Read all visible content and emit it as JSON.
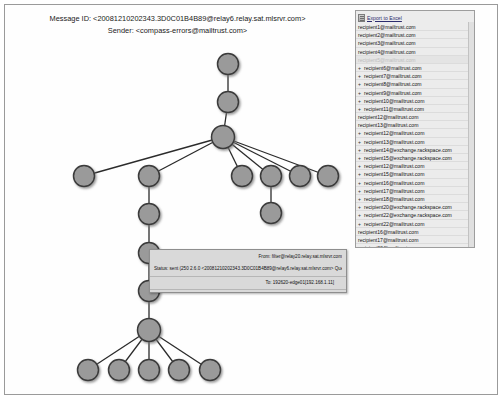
{
  "header": {
    "message_id_label": "Message ID:",
    "message_id": "<20081210202343.3D0C01B4B89@relay6.relay.sat.mlsrvr.com>",
    "message_id_line": "Message ID: <20081210202343.3D0C01B4B89@relay6.relay.sat.mlsrvr.com>",
    "sender_label": "Sender:",
    "sender": "<compass-errors@mailtrust.com>",
    "sender_line": "Sender: <compass-errors@mailtrust.com>"
  },
  "recipients_panel": {
    "export_label": "Export to Excel",
    "export_icon": "excel-icon",
    "items": [
      {
        "marker": "",
        "address": "recipient1@mailtrust.com",
        "selected": false
      },
      {
        "marker": "",
        "address": "recipient2@mailtrust.com",
        "selected": false
      },
      {
        "marker": "",
        "address": "recipient3@mailtrust.com",
        "selected": false
      },
      {
        "marker": "",
        "address": "recipient4@mailtrust.com",
        "selected": false
      },
      {
        "marker": "",
        "address": "recipient5@mailtrust.com",
        "selected": true
      },
      {
        "marker": "+",
        "address": "recipient6@mailtrust.com",
        "selected": false
      },
      {
        "marker": "+",
        "address": "recipient7@mailtrust.com",
        "selected": false
      },
      {
        "marker": "+",
        "address": "recipient8@mailtrust.com",
        "selected": false
      },
      {
        "marker": "+",
        "address": "recipient9@mailtrust.com",
        "selected": false
      },
      {
        "marker": "+",
        "address": "recipient10@mailtrust.com",
        "selected": false
      },
      {
        "marker": "+",
        "address": "recipient11@mailtrust.com",
        "selected": false
      },
      {
        "marker": "",
        "address": "recipient12@mailtrust.com",
        "selected": false
      },
      {
        "marker": "",
        "address": "recipient13@mailtrust.com",
        "selected": false
      },
      {
        "marker": "+",
        "address": "recipient12@mailtrust.com",
        "selected": false
      },
      {
        "marker": "+",
        "address": "recipient13@mailtrust.com",
        "selected": false
      },
      {
        "marker": "+",
        "address": "recipient14@exchange.rackspace.com",
        "selected": false
      },
      {
        "marker": "+",
        "address": "recipient15@exchange.rackspace.com",
        "selected": false
      },
      {
        "marker": "+",
        "address": "recipient12@mailtrust.com",
        "selected": false
      },
      {
        "marker": "+",
        "address": "recipient15@mailtrust.com",
        "selected": false
      },
      {
        "marker": "+",
        "address": "recipient16@mailtrust.com",
        "selected": false
      },
      {
        "marker": "+",
        "address": "recipient17@mailtrust.com",
        "selected": false
      },
      {
        "marker": "+",
        "address": "recipient18@mailtrust.com",
        "selected": false
      },
      {
        "marker": "+",
        "address": "recipient20@exchange.rackspace.com",
        "selected": false
      },
      {
        "marker": "+",
        "address": "recipient22@exchange.rackspace.com",
        "selected": false
      },
      {
        "marker": "+",
        "address": "recipient22@mailtrust.com",
        "selected": false
      },
      {
        "marker": "",
        "address": "recipient16@mailtrust.com",
        "selected": false
      },
      {
        "marker": "",
        "address": "recipient17@mailtrust.com",
        "selected": false
      },
      {
        "marker": "",
        "address": "recipient23@mailtrust.com",
        "selected": false
      },
      {
        "marker": "",
        "address": "recipient19@mailtrust.com",
        "selected": false
      },
      {
        "marker": "",
        "address": "recipient24@mailtrust.com",
        "selected": false
      },
      {
        "marker": "",
        "address": "recipient22@mailtrust.com",
        "selected": false
      }
    ]
  },
  "infobox": {
    "from_line": "From: filter@relay20.relay.sat.mlsrvr.com",
    "status_line": "Status: sent (250 2.6.0 <20081210202343.3D0C01B4B89@relay6.relay.sat.mlsrvr.com> Queued mail for delivery) 2008-12-10 15:23:43",
    "to_line": "To: 192620-edge01[192.168.1.11]"
  },
  "graph": {
    "node_fill": "#9a9a9a",
    "node_stroke": "#3a3a3a",
    "edge_color": "#2b2b2b",
    "nodes": [
      {
        "id": "n1",
        "name": "root-node",
        "x": 222,
        "y": 58,
        "r": 10.5
      },
      {
        "id": "n2",
        "name": "relay-node",
        "x": 222,
        "y": 96,
        "r": 10.5
      },
      {
        "id": "n3",
        "name": "hub-node",
        "x": 217,
        "y": 131,
        "r": 11.5
      },
      {
        "id": "n4",
        "name": "branch-left-far",
        "x": 78,
        "y": 170,
        "r": 10.5
      },
      {
        "id": "n5",
        "name": "branch-left-mid",
        "x": 143,
        "y": 170,
        "r": 10.5
      },
      {
        "id": "n6",
        "name": "branch-right-1",
        "x": 236,
        "y": 170,
        "r": 10.5
      },
      {
        "id": "n7",
        "name": "branch-right-2",
        "x": 265,
        "y": 170,
        "r": 10.5
      },
      {
        "id": "n8",
        "name": "branch-right-3",
        "x": 294,
        "y": 170,
        "r": 10.5
      },
      {
        "id": "n9",
        "name": "branch-right-4",
        "x": 322,
        "y": 170,
        "r": 10.5
      },
      {
        "id": "n10",
        "name": "leaf-under-right-2",
        "x": 265,
        "y": 207,
        "r": 10.5
      },
      {
        "id": "n11",
        "name": "chain-node-1",
        "x": 143,
        "y": 208,
        "r": 10.5
      },
      {
        "id": "n12",
        "name": "chain-node-2",
        "x": 143,
        "y": 247,
        "r": 10.5
      },
      {
        "id": "n13",
        "name": "chain-node-3",
        "x": 143,
        "y": 285,
        "r": 10.5
      },
      {
        "id": "n14",
        "name": "chain-node-4",
        "x": 143,
        "y": 324,
        "r": 11.5
      },
      {
        "id": "n15",
        "name": "leaf-1",
        "x": 82,
        "y": 364,
        "r": 10.5
      },
      {
        "id": "n16",
        "name": "leaf-2",
        "x": 113,
        "y": 364,
        "r": 10.5
      },
      {
        "id": "n17",
        "name": "leaf-3",
        "x": 143,
        "y": 364,
        "r": 10.5
      },
      {
        "id": "n18",
        "name": "leaf-4",
        "x": 173,
        "y": 364,
        "r": 10.5
      },
      {
        "id": "n19",
        "name": "leaf-5",
        "x": 204,
        "y": 364,
        "r": 10.5
      }
    ],
    "edges": [
      [
        "n1",
        "n2"
      ],
      [
        "n2",
        "n3"
      ],
      [
        "n3",
        "n4"
      ],
      [
        "n3",
        "n5"
      ],
      [
        "n3",
        "n6"
      ],
      [
        "n3",
        "n7"
      ],
      [
        "n3",
        "n8"
      ],
      [
        "n3",
        "n9"
      ],
      [
        "n7",
        "n10"
      ],
      [
        "n5",
        "n11"
      ],
      [
        "n11",
        "n12"
      ],
      [
        "n12",
        "n13"
      ],
      [
        "n13",
        "n14"
      ],
      [
        "n14",
        "n15"
      ],
      [
        "n14",
        "n16"
      ],
      [
        "n14",
        "n17"
      ],
      [
        "n14",
        "n18"
      ],
      [
        "n14",
        "n19"
      ]
    ]
  }
}
